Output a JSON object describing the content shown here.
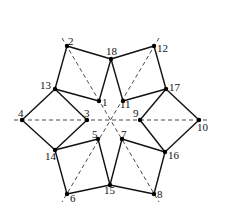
{
  "diagram": {
    "title": "",
    "center": [
      114,
      120
    ],
    "points": [
      {
        "id": "1",
        "x": 99,
        "y": 101,
        "lx": 102,
        "ly": 106
      },
      {
        "id": "2",
        "x": 67,
        "y": 46,
        "lx": 68,
        "ly": 45
      },
      {
        "id": "3",
        "x": 87,
        "y": 120,
        "lx": 84,
        "ly": 117
      },
      {
        "id": "4",
        "x": 22,
        "y": 120,
        "lx": 18,
        "ly": 117
      },
      {
        "id": "5",
        "x": 98,
        "y": 139,
        "lx": 92,
        "ly": 138
      },
      {
        "id": "6",
        "x": 67,
        "y": 194,
        "lx": 70,
        "ly": 202
      },
      {
        "id": "7",
        "x": 122,
        "y": 139,
        "lx": 121,
        "ly": 138
      },
      {
        "id": "8",
        "x": 154,
        "y": 194,
        "lx": 157,
        "ly": 198
      },
      {
        "id": "9",
        "x": 140,
        "y": 120,
        "lx": 133,
        "ly": 117
      },
      {
        "id": "10",
        "x": 199,
        "y": 120,
        "lx": 197,
        "ly": 131
      },
      {
        "id": "11",
        "x": 123,
        "y": 101,
        "lx": 120,
        "ly": 108
      },
      {
        "id": "12",
        "x": 154,
        "y": 46,
        "lx": 157,
        "ly": 52
      },
      {
        "id": "13",
        "x": 55,
        "y": 89,
        "lx": 40,
        "ly": 89
      },
      {
        "id": "14",
        "x": 55,
        "y": 150,
        "lx": 45,
        "ly": 160
      },
      {
        "id": "15",
        "x": 110,
        "y": 185,
        "lx": 104,
        "ly": 194
      },
      {
        "id": "16",
        "x": 165,
        "y": 152,
        "lx": 168,
        "ly": 159
      },
      {
        "id": "17",
        "x": 166,
        "y": 89,
        "lx": 169,
        "ly": 91
      },
      {
        "id": "18",
        "x": 111,
        "y": 59,
        "lx": 106,
        "ly": 55
      }
    ],
    "edges": [
      [
        "2",
        "18"
      ],
      [
        "18",
        "1"
      ],
      [
        "1",
        "13"
      ],
      [
        "13",
        "2"
      ],
      [
        "18",
        "12"
      ],
      [
        "12",
        "17"
      ],
      [
        "17",
        "11"
      ],
      [
        "11",
        "18"
      ],
      [
        "13",
        "4"
      ],
      [
        "4",
        "14"
      ],
      [
        "14",
        "3"
      ],
      [
        "3",
        "13"
      ],
      [
        "17",
        "10"
      ],
      [
        "10",
        "16"
      ],
      [
        "16",
        "9"
      ],
      [
        "9",
        "17"
      ],
      [
        "14",
        "5"
      ],
      [
        "5",
        "15"
      ],
      [
        "15",
        "6"
      ],
      [
        "6",
        "14"
      ],
      [
        "15",
        "7"
      ],
      [
        "7",
        "16"
      ],
      [
        "16",
        "8"
      ],
      [
        "8",
        "15"
      ]
    ],
    "dashed_lines": [
      {
        "from": [
          62,
          38
        ],
        "to": [
          159,
          202
        ]
      },
      {
        "from": [
          159,
          38
        ],
        "to": [
          62,
          202
        ]
      },
      {
        "from": [
          14,
          120
        ],
        "to": [
          210,
          120
        ]
      }
    ]
  }
}
